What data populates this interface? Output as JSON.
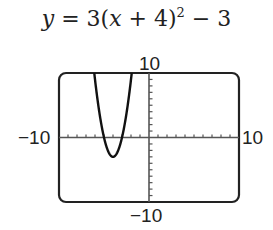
{
  "chart_data": {
    "type": "line",
    "equation": "y = 3(x + 4)^2 - 3",
    "xlabel": "",
    "ylabel": "",
    "xlim": [
      -10,
      10
    ],
    "ylim": [
      -10,
      10
    ],
    "xscale": 1,
    "yscale": 1,
    "grid": false,
    "tick_labels": {
      "x_min": "−10",
      "x_max": "10",
      "y_min": "−10",
      "y_max": "10"
    },
    "series": [
      {
        "name": "y = 3(x + 4)^2 - 3",
        "x": [
          -6.2,
          -6.0,
          -5.5,
          -5.0,
          -4.5,
          -4.0,
          -3.5,
          -3.0,
          -2.5,
          -2.0,
          -1.8
        ],
        "values": [
          11.52,
          9.0,
          3.75,
          0.0,
          -2.25,
          -3.0,
          -2.25,
          0.0,
          3.75,
          9.0,
          11.52
        ]
      }
    ],
    "vertex": {
      "x": -4,
      "y": -3
    }
  }
}
